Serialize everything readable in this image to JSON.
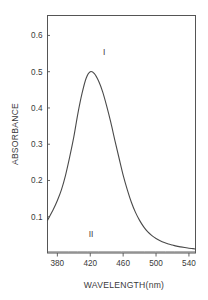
{
  "chart_data": {
    "type": "line",
    "title": "",
    "xlabel": "WAVELENGTH(nm)",
    "ylabel": "ABSORBANCE",
    "xlim": [
      368,
      548
    ],
    "ylim": [
      0.0,
      0.655
    ],
    "grid": false,
    "legend_position": "inline-annotation",
    "xticks": [
      380,
      420,
      460,
      500,
      540
    ],
    "xtick_labels": [
      "380",
      "420",
      "460",
      "500",
      "540"
    ],
    "yticks": [
      0.1,
      0.2,
      0.3,
      0.4,
      0.5,
      0.6
    ],
    "ytick_labels": [
      "0.1",
      "0.2",
      "0.3",
      "0.4",
      "0.5",
      "0.6"
    ],
    "annotations": [
      {
        "text": "I",
        "x": 437,
        "y": 0.545
      },
      {
        "text": "II",
        "x": 421,
        "y": 0.045
      }
    ],
    "series": [
      {
        "name": "I",
        "peak_wavelength": 420,
        "peak_absorbance": 0.5,
        "x": [
          368,
          375,
          380,
          385,
          390,
          395,
          400,
          405,
          410,
          415,
          420,
          425,
          430,
          435,
          440,
          445,
          450,
          455,
          460,
          465,
          470,
          475,
          480,
          485,
          490,
          495,
          500,
          505,
          510,
          515,
          520,
          525,
          530,
          535,
          540,
          545,
          548
        ],
        "values": [
          0.09,
          0.12,
          0.145,
          0.175,
          0.215,
          0.265,
          0.32,
          0.385,
          0.44,
          0.482,
          0.5,
          0.495,
          0.475,
          0.445,
          0.405,
          0.36,
          0.31,
          0.262,
          0.215,
          0.175,
          0.14,
          0.112,
          0.09,
          0.072,
          0.058,
          0.048,
          0.04,
          0.034,
          0.029,
          0.025,
          0.022,
          0.019,
          0.017,
          0.015,
          0.013,
          0.012,
          0.011
        ]
      },
      {
        "name": "II",
        "peak_wavelength": null,
        "peak_absorbance": 0.0,
        "x": [
          368,
          548
        ],
        "values": [
          0.003,
          0.003
        ]
      }
    ]
  },
  "figure": {
    "caption": "",
    "background_color": "#ffffff",
    "axis_color": "#555555",
    "curve_color": "#4a4a4a",
    "text_color": "#3a3a3a"
  }
}
